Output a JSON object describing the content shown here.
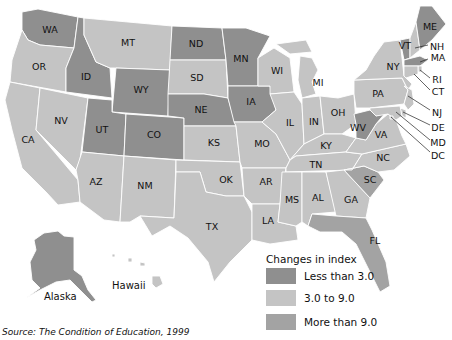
{
  "legend": {
    "title": "Changes in index",
    "items": [
      {
        "key": "low",
        "label": "Less than 3.0",
        "color": "#8f8f8f"
      },
      {
        "key": "mid",
        "label": "3.0 to 9.0",
        "color": "#c4c4c4"
      },
      {
        "key": "high",
        "label": "More than 9.0",
        "color": "#a3a3a3"
      }
    ]
  },
  "insets": {
    "alaska": "Alaska",
    "hawaii": "Hawaii"
  },
  "source": "Source: The Condition of Education, 1999",
  "states": {
    "WA": "low",
    "OR": "mid",
    "CA": "mid",
    "NV": "mid",
    "ID": "low",
    "MT": "mid",
    "WY": "low",
    "UT": "low",
    "CO": "low",
    "AZ": "mid",
    "NM": "mid",
    "ND": "low",
    "SD": "mid",
    "NE": "low",
    "KS": "mid",
    "OK": "mid",
    "TX": "mid",
    "MN": "low",
    "IA": "low",
    "MO": "mid",
    "AR": "mid",
    "LA": "mid",
    "WI": "mid",
    "IL": "mid",
    "MI": "mid",
    "IN": "mid",
    "OH": "mid",
    "KY": "mid",
    "TN": "mid",
    "MS": "mid",
    "AL": "mid",
    "GA": "mid",
    "FL": "high",
    "SC": "high",
    "NC": "mid",
    "VA": "mid",
    "WV": "low",
    "PA": "mid",
    "NY": "mid",
    "VT": "low",
    "NH": "mid",
    "ME": "low",
    "MA": "low",
    "RI": "mid",
    "CT": "mid",
    "NJ": "mid",
    "DE": "mid",
    "MD": "mid",
    "DC": "mid",
    "AK": "low",
    "HI": "mid"
  },
  "labels": {
    "WA": "WA",
    "OR": "OR",
    "CA": "CA",
    "NV": "NV",
    "ID": "ID",
    "MT": "MT",
    "WY": "WY",
    "UT": "UT",
    "CO": "CO",
    "AZ": "AZ",
    "NM": "NM",
    "ND": "ND",
    "SD": "SD",
    "NE": "NE",
    "KS": "KS",
    "OK": "OK",
    "TX": "TX",
    "MN": "MN",
    "IA": "IA",
    "MO": "MO",
    "AR": "AR",
    "LA": "LA",
    "WI": "WI",
    "IL": "IL",
    "MI": "MI",
    "IN": "IN",
    "OH": "OH",
    "KY": "KY",
    "TN": "TN",
    "MS": "MS",
    "AL": "AL",
    "GA": "GA",
    "FL": "FL",
    "SC": "SC",
    "NC": "NC",
    "VA": "VA",
    "WV": "WV",
    "PA": "PA",
    "NY": "NY",
    "VT": "VT",
    "NH": "NH",
    "ME": "ME",
    "MA": "MA",
    "RI": "RI",
    "CT": "CT",
    "NJ": "NJ",
    "DE": "DE",
    "MD": "MD",
    "DC": "DC"
  }
}
